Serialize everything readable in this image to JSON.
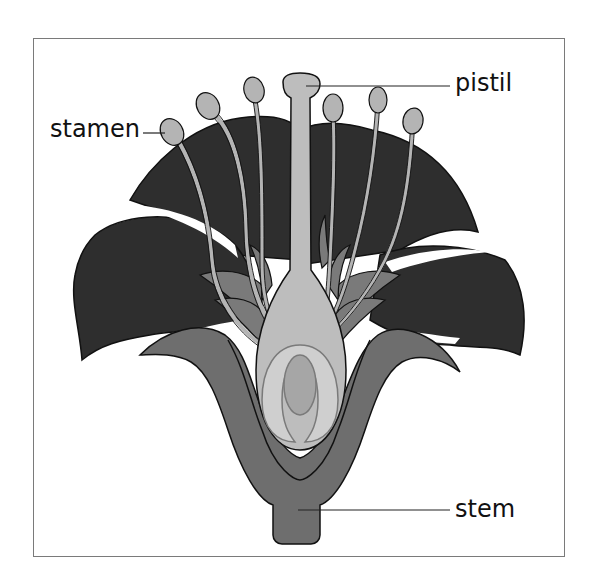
{
  "diagram": {
    "labels": {
      "stamen": "stamen",
      "pistil": "pistil",
      "stem": "stem"
    },
    "colors": {
      "petal": "#2e2e2e",
      "sepal": "#6e6e6e",
      "receptacle": "#8c8c8c",
      "stamen": "#b4b4b4",
      "pistil": "#bdbdbd",
      "ovary_inner": "#cfcfcf",
      "ovule": "#a6a6a6",
      "outline": "#111111",
      "frame": "#7a7a7a"
    }
  }
}
